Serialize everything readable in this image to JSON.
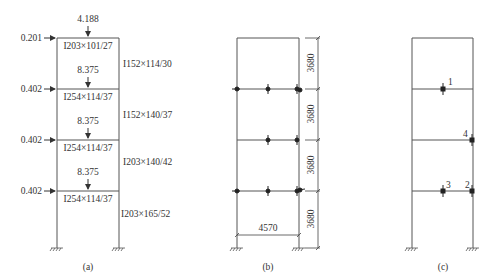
{
  "panel_a": {
    "caption": "(a)",
    "top_point_load": "4.188",
    "floor_point_loads": [
      "8.375",
      "8.375",
      "8.375"
    ],
    "lateral_loads": [
      "0.201",
      "0.402",
      "0.402",
      "0.402"
    ],
    "beam_sections": [
      "I203×101/27",
      "I254×114/37",
      "I254×114/37",
      "I254×114/37"
    ],
    "column_sections": [
      "I152×114/30",
      "I152×140/37",
      "I203×140/42",
      "I203×165/52"
    ]
  },
  "panel_b": {
    "caption": "(b)",
    "bay_width": "4570",
    "storey_heights": [
      "3680",
      "3680",
      "3680",
      "3680"
    ]
  },
  "panel_c": {
    "caption": "(c)",
    "point_labels": [
      "1",
      "2",
      "3",
      "4"
    ]
  },
  "colors": {
    "line": "#444444",
    "text": "#333333"
  }
}
